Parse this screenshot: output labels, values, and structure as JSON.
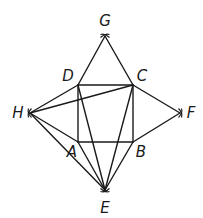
{
  "figure": {
    "type": "geometric-construction",
    "stroke_color": "#1a1a1a",
    "background": "#ffffff"
  },
  "points": {
    "A": {
      "label": "A",
      "x": 78,
      "y": 142,
      "label_x": 72,
      "label_y": 152
    },
    "B": {
      "label": "B",
      "x": 133,
      "y": 142,
      "label_x": 141,
      "label_y": 152
    },
    "C": {
      "label": "C",
      "x": 133,
      "y": 85,
      "label_x": 142,
      "label_y": 76
    },
    "D": {
      "label": "D",
      "x": 78,
      "y": 85,
      "label_x": 68,
      "label_y": 76
    },
    "E": {
      "label": "E",
      "x": 105,
      "y": 190,
      "label_x": 105,
      "label_y": 208
    },
    "F": {
      "label": "F",
      "x": 180,
      "y": 113,
      "label_x": 191,
      "label_y": 113
    },
    "G": {
      "label": "G",
      "x": 105,
      "y": 36,
      "label_x": 105,
      "label_y": 21
    },
    "H": {
      "label": "H",
      "x": 30,
      "y": 113,
      "label_x": 18,
      "label_y": 113
    }
  },
  "segments": [
    [
      "A",
      "B"
    ],
    [
      "B",
      "C"
    ],
    [
      "C",
      "D"
    ],
    [
      "D",
      "A"
    ],
    [
      "D",
      "G"
    ],
    [
      "G",
      "C"
    ],
    [
      "C",
      "F"
    ],
    [
      "F",
      "B"
    ],
    [
      "H",
      "D"
    ],
    [
      "H",
      "C"
    ],
    [
      "H",
      "A"
    ],
    [
      "H",
      "E"
    ],
    [
      "A",
      "E"
    ],
    [
      "B",
      "E"
    ],
    [
      "D",
      "E"
    ],
    [
      "C",
      "E"
    ]
  ],
  "construction_marks": [
    "G",
    "F",
    "E",
    "H"
  ],
  "labels": [
    "A",
    "B",
    "C",
    "D",
    "E",
    "F",
    "G",
    "H"
  ]
}
